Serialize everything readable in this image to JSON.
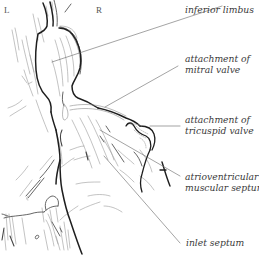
{
  "diagram": {
    "orientation": {
      "left": "L",
      "right": "R"
    },
    "labels": [
      {
        "id": "inferior-limbus",
        "lines": [
          "inferior limbus"
        ]
      },
      {
        "id": "attachment-mitral-valve",
        "lines": [
          "attachment of",
          "mitral valve"
        ]
      },
      {
        "id": "attachment-tricuspid-valve",
        "lines": [
          "attachment of",
          "tricuspid valve"
        ]
      },
      {
        "id": "atrioventricular-muscular-septum",
        "lines": [
          "atrioventricular",
          "muscular septum"
        ]
      },
      {
        "id": "inlet-septum",
        "lines": [
          "inlet septum"
        ]
      }
    ],
    "colors": {
      "outline": "#222222",
      "sketch": "#8a8a8a",
      "leader": "#666666",
      "text": "#3a3a3a"
    }
  }
}
